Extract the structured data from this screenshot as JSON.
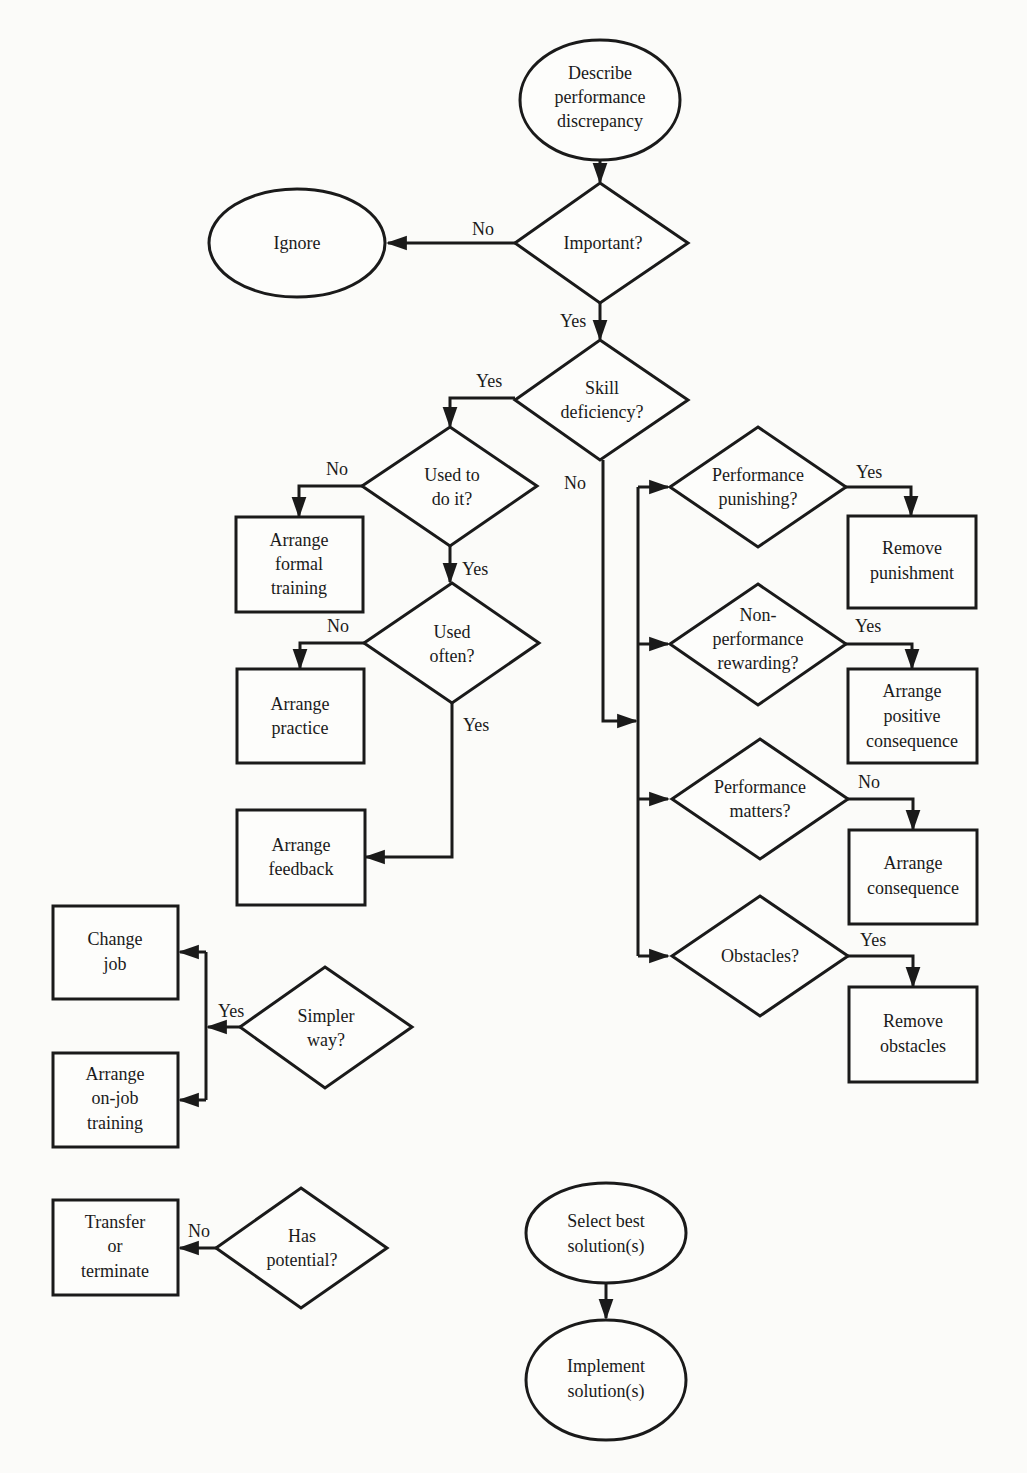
{
  "diagram": {
    "type": "flowchart",
    "colors": {
      "stroke": "#1a1a1a",
      "background": "#fbfbf9"
    },
    "nodes": {
      "describe": {
        "shape": "ellipse",
        "lines": [
          "Describe",
          "performance",
          "discrepancy"
        ]
      },
      "important": {
        "shape": "diamond",
        "lines": [
          "Important?"
        ]
      },
      "ignore": {
        "shape": "ellipse",
        "lines": [
          "Ignore"
        ]
      },
      "skill_deficiency": {
        "shape": "diamond",
        "lines": [
          "Skill",
          "deficiency?"
        ]
      },
      "used_to_do_it": {
        "shape": "diamond",
        "lines": [
          "Used to",
          "do it?"
        ]
      },
      "arrange_formal_training": {
        "shape": "box",
        "lines": [
          "Arrange",
          "formal",
          "training"
        ]
      },
      "used_often": {
        "shape": "diamond",
        "lines": [
          "Used",
          "often?"
        ]
      },
      "arrange_practice": {
        "shape": "box",
        "lines": [
          "Arrange",
          "practice"
        ]
      },
      "arrange_feedback": {
        "shape": "box",
        "lines": [
          "Arrange",
          "feedback"
        ]
      },
      "performance_punishing": {
        "shape": "diamond",
        "lines": [
          "Performance",
          "punishing?"
        ]
      },
      "remove_punishment": {
        "shape": "box",
        "lines": [
          "Remove",
          "punishment"
        ]
      },
      "nonperformance_rewarding": {
        "shape": "diamond",
        "lines": [
          "Non-",
          "performance",
          "rewarding?"
        ]
      },
      "arrange_positive_consequence": {
        "shape": "box",
        "lines": [
          "Arrange",
          "positive",
          "consequence"
        ]
      },
      "performance_matters": {
        "shape": "diamond",
        "lines": [
          "Performance",
          "matters?"
        ]
      },
      "arrange_consequence": {
        "shape": "box",
        "lines": [
          "Arrange",
          "consequence"
        ]
      },
      "obstacles": {
        "shape": "diamond",
        "lines": [
          "Obstacles?"
        ]
      },
      "remove_obstacles": {
        "shape": "box",
        "lines": [
          "Remove",
          "obstacles"
        ]
      },
      "change_job": {
        "shape": "box",
        "lines": [
          "Change",
          "job"
        ]
      },
      "simpler_way": {
        "shape": "diamond",
        "lines": [
          "Simpler",
          "way?"
        ]
      },
      "arrange_on_job_training": {
        "shape": "box",
        "lines": [
          "Arrange",
          "on-job",
          "training"
        ]
      },
      "transfer_or_terminate": {
        "shape": "box",
        "lines": [
          "Transfer",
          "or",
          "terminate"
        ]
      },
      "has_potential": {
        "shape": "diamond",
        "lines": [
          "Has",
          "potential?"
        ]
      },
      "select_best": {
        "shape": "ellipse",
        "lines": [
          "Select best",
          "solution(s)"
        ]
      },
      "implement": {
        "shape": "ellipse",
        "lines": [
          "Implement",
          "solution(s)"
        ]
      }
    },
    "edge_labels": {
      "important_no": "No",
      "important_yes": "Yes",
      "skill_yes": "Yes",
      "skill_no": "No",
      "used_to_no": "No",
      "used_to_yes": "Yes",
      "used_often_no": "No",
      "used_often_yes": "Yes",
      "punishing_yes": "Yes",
      "rewarding_yes": "Yes",
      "matters_no": "No",
      "obstacles_yes": "Yes",
      "simpler_yes": "Yes",
      "potential_no": "No"
    },
    "edges": [
      {
        "from": "describe",
        "to": "important",
        "label": ""
      },
      {
        "from": "important",
        "to": "ignore",
        "label": "No"
      },
      {
        "from": "important",
        "to": "skill_deficiency",
        "label": "Yes"
      },
      {
        "from": "skill_deficiency",
        "to": "used_to_do_it",
        "label": "Yes"
      },
      {
        "from": "skill_deficiency",
        "to": "performance_punishing|nonperformance_rewarding|performance_matters|obstacles",
        "label": "No"
      },
      {
        "from": "used_to_do_it",
        "to": "arrange_formal_training",
        "label": "No"
      },
      {
        "from": "used_to_do_it",
        "to": "used_often",
        "label": "Yes"
      },
      {
        "from": "used_often",
        "to": "arrange_practice",
        "label": "No"
      },
      {
        "from": "used_often",
        "to": "arrange_feedback",
        "label": "Yes"
      },
      {
        "from": "performance_punishing",
        "to": "remove_punishment",
        "label": "Yes"
      },
      {
        "from": "nonperformance_rewarding",
        "to": "arrange_positive_consequence",
        "label": "Yes"
      },
      {
        "from": "performance_matters",
        "to": "arrange_consequence",
        "label": "No"
      },
      {
        "from": "obstacles",
        "to": "remove_obstacles",
        "label": "Yes"
      },
      {
        "from": "simpler_way",
        "to": "change_job|arrange_on_job_training",
        "label": "Yes"
      },
      {
        "from": "has_potential",
        "to": "transfer_or_terminate",
        "label": "No"
      },
      {
        "from": "select_best",
        "to": "implement",
        "label": ""
      }
    ]
  }
}
